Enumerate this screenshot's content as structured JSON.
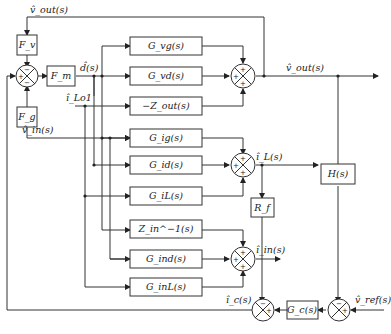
{
  "diagram": {
    "blocks": {
      "fv": "F_v",
      "fm": "F_m",
      "fg": "F_g",
      "gvg": "G_vg(s)",
      "gvd": "G_vd(s)",
      "zout": "−Z_out(s)",
      "gig": "G_ig(s)",
      "gid": "G_id(s)",
      "gil": "G_iL(s)",
      "zin": "Z_in^−1(s)",
      "gind": "G_ind(s)",
      "ginl": "G_inL(s)",
      "rf": "R_f",
      "h": "H(s)",
      "gc": "G_c(s)"
    },
    "signals": {
      "vout_top": "v̂_out(s)",
      "d": "d̂(s)",
      "ilo1": "î_Lo1",
      "vin": "v̂_in(s)",
      "vout": "v̂_out(s)",
      "il": "î_L(s)",
      "iin": "î_in(s)",
      "ic": "î_c(s)",
      "vref": "v̂_ref(s)"
    },
    "summing_junctions": {
      "input_sum": {
        "top": "−",
        "left": "+",
        "bottom": "−"
      },
      "vout_sum": {
        "top": "+",
        "left": "+",
        "bottom": "+"
      },
      "il_sum": {
        "top": "+",
        "left": "+",
        "bottom": "+"
      },
      "iin_sum": {
        "top": "+",
        "left": "+",
        "bottom": "+"
      },
      "ic_sum": {
        "top": "−",
        "right": "+"
      },
      "vref_sum": {
        "top": "−",
        "right": "+"
      }
    }
  }
}
